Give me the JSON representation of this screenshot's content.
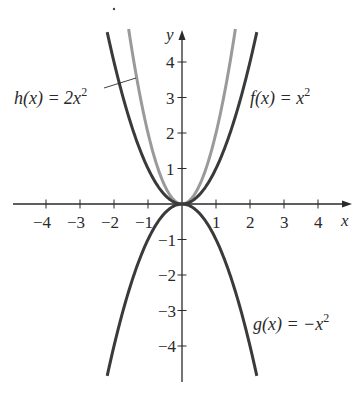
{
  "chart_data": {
    "type": "line",
    "title": "",
    "xlabel": "x",
    "ylabel": "y",
    "xlim": [
      -5,
      5
    ],
    "ylim": [
      -5,
      5
    ],
    "grid": false,
    "x_ticks": [
      -4,
      -3,
      -2,
      -1,
      1,
      2,
      3,
      4
    ],
    "y_ticks": [
      -4,
      -3,
      -2,
      -1,
      1,
      2,
      3,
      4
    ],
    "x_tick_labels": [
      "−4",
      "−3",
      "−2",
      "−1",
      "1",
      "2",
      "3",
      "4"
    ],
    "y_tick_labels": [
      "−4",
      "−3",
      "−2",
      "−1",
      "1",
      "2",
      "3",
      "4"
    ],
    "series": [
      {
        "name": "f(x) = x²",
        "label_main": "f(x) = x",
        "label_exp": "2",
        "expression": "x^2",
        "coef": 1,
        "color": "#3a3a3a",
        "x_range": [
          -2.2,
          2.2
        ],
        "x": [
          -2,
          -1,
          0,
          1,
          2
        ],
        "values": [
          4,
          1,
          0,
          1,
          4
        ]
      },
      {
        "name": "h(x) = 2x²",
        "label_main": "h(x) = 2x",
        "label_exp": "2",
        "expression": "2x^2",
        "coef": 2,
        "color": "#9a9a9a",
        "x_range": [
          -1.57,
          1.57
        ],
        "x": [
          -1.5,
          -1,
          0,
          1,
          1.5
        ],
        "values": [
          4.5,
          2,
          0,
          2,
          4.5
        ]
      },
      {
        "name": "g(x) = −x²",
        "label_main": "g(x) = −x",
        "label_exp": "2",
        "expression": "-x^2",
        "coef": -1,
        "color": "#3a3a3a",
        "x_range": [
          -2.2,
          2.2
        ],
        "x": [
          -2,
          -1,
          0,
          1,
          2
        ],
        "values": [
          -4,
          -1,
          0,
          -1,
          -4
        ]
      }
    ],
    "annotations": [
      {
        "text": "h(x) = 2x²",
        "pointer": "leader line to gray curve"
      },
      {
        "text": "f(x) = x²",
        "position": "right of upper-right branch"
      },
      {
        "text": "g(x) = −x²",
        "position": "right of lower-right branch"
      }
    ]
  }
}
